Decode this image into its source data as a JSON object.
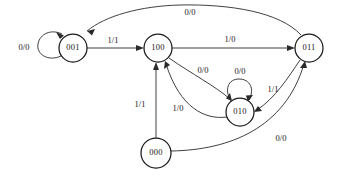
{
  "diagram": {
    "type": "finite-state-machine",
    "title": "",
    "canvas": {
      "width": 337,
      "height": 176
    },
    "states": [
      {
        "id": "s001",
        "label": "001",
        "cx": 73,
        "cy": 48,
        "r": 14
      },
      {
        "id": "s100",
        "label": "100",
        "cx": 158,
        "cy": 48,
        "r": 14
      },
      {
        "id": "s011",
        "label": "011",
        "cx": 309,
        "cy": 48,
        "r": 14
      },
      {
        "id": "s010",
        "label": "010",
        "cx": 240,
        "cy": 112,
        "r": 14
      },
      {
        "id": "s000",
        "label": "000",
        "cx": 156,
        "cy": 153,
        "r": 15
      }
    ],
    "transitions": [
      {
        "id": "t1",
        "from": "001",
        "to": "001",
        "label": "0/0",
        "label_x": 24,
        "label_y": 48
      },
      {
        "id": "t2",
        "from": "001",
        "to": "100",
        "label": "1/1",
        "label_x": 113,
        "label_y": 41
      },
      {
        "id": "t3",
        "from": "100",
        "to": "011",
        "label": "1/0",
        "label_x": 230,
        "label_y": 40
      },
      {
        "id": "t4",
        "from": "011",
        "to": "001",
        "label": "0/0",
        "label_x": 190,
        "label_y": 13
      },
      {
        "id": "t5",
        "from": "100",
        "to": "010",
        "label": "0/0",
        "label_x": 203,
        "label_y": 71
      },
      {
        "id": "t6",
        "from": "010",
        "to": "010",
        "label": "0/0",
        "label_x": 240,
        "label_y": 72
      },
      {
        "id": "t7",
        "from": "010",
        "to": "100",
        "label": "1/0",
        "label_x": 178,
        "label_y": 109
      },
      {
        "id": "t8",
        "from": "011",
        "to": "010",
        "label": "1/1",
        "label_x": 273,
        "label_y": 90
      },
      {
        "id": "t9",
        "from": "000",
        "to": "100",
        "label": "1/1",
        "label_x": 140,
        "label_y": 105
      },
      {
        "id": "t10",
        "from": "000",
        "to": "011",
        "label": "0/0",
        "label_x": 281,
        "label_y": 139
      }
    ],
    "colors": {
      "stroke": "#1a1a1a",
      "edge": "#2a2a2a",
      "node_fill": "#ffffff",
      "background": "#ffffff"
    }
  }
}
